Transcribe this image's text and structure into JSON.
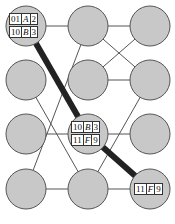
{
  "diagram": {
    "node_radius": 20,
    "node_fill": "#c8c8c8",
    "node_stroke": "#555555",
    "edge_color": "#555555",
    "path_color": "#222222",
    "nodes": [
      {
        "id": "r1c1",
        "x": 26,
        "y": 26
      },
      {
        "id": "r1c2",
        "x": 88,
        "y": 26
      },
      {
        "id": "r1c3",
        "x": 150,
        "y": 26
      },
      {
        "id": "r2c1",
        "x": 26,
        "y": 80
      },
      {
        "id": "r2c2",
        "x": 88,
        "y": 80
      },
      {
        "id": "r2c3",
        "x": 150,
        "y": 80
      },
      {
        "id": "r3c1",
        "x": 26,
        "y": 134
      },
      {
        "id": "r3c2",
        "x": 88,
        "y": 134
      },
      {
        "id": "r3c3",
        "x": 150,
        "y": 134
      },
      {
        "id": "r4c1",
        "x": 26,
        "y": 189
      },
      {
        "id": "r4c2",
        "x": 88,
        "y": 189
      },
      {
        "id": "r4c3",
        "x": 150,
        "y": 189
      }
    ],
    "edges": [
      [
        "r1c1",
        "r1c2"
      ],
      [
        "r1c2",
        "r1c3"
      ],
      [
        "r1c2",
        "r2c3"
      ],
      [
        "r1c3",
        "r2c2"
      ],
      [
        "r2c2",
        "r2c3"
      ],
      [
        "r1c2",
        "r4c1"
      ],
      [
        "r2c1",
        "r4c2"
      ],
      [
        "r3c1",
        "r3c2"
      ],
      [
        "r3c2",
        "r3c3"
      ],
      [
        "r2c3",
        "r4c2"
      ],
      [
        "r4c1",
        "r4c2"
      ],
      [
        "r4c2",
        "r4c3"
      ]
    ],
    "highlight_path": [
      "r1c1",
      "r3c2",
      "r4c3"
    ],
    "labels": [
      {
        "node": "r1c1",
        "rows": [
          [
            "01",
            "A",
            "2"
          ],
          [
            "10",
            "B",
            "3"
          ]
        ]
      },
      {
        "node": "r3c2",
        "rows": [
          [
            "10",
            "B",
            "3"
          ],
          [
            "11",
            "F",
            "9"
          ]
        ]
      },
      {
        "node": "r4c3",
        "rows": [
          [
            "11",
            "F",
            "9"
          ]
        ]
      }
    ]
  },
  "label_text": {
    "n1_r0_c0": "01",
    "n1_r0_c1": "A",
    "n1_r0_c2": "2",
    "n1_r1_c0": "10",
    "n1_r1_c1": "B",
    "n1_r1_c2": "3",
    "n2_r0_c0": "10",
    "n2_r0_c1": "B",
    "n2_r0_c2": "3",
    "n2_r1_c0": "11",
    "n2_r1_c1": "F",
    "n2_r1_c2": "9",
    "n3_r0_c0": "11",
    "n3_r0_c1": "F",
    "n3_r0_c2": "9"
  }
}
